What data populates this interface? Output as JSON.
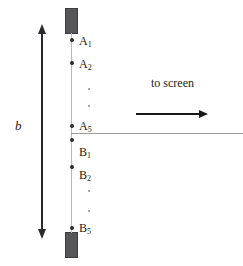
{
  "figure": {
    "background_color": "#ffffff",
    "width": 243,
    "height": 266
  },
  "colors": {
    "bar_fill": "#56565a",
    "bar_stroke": "#3d3d41",
    "slit_plane_line": "#b9b9bd",
    "optical_axis_line": "#9d9da1",
    "marker": "#2b2b2f",
    "ellipsis": "#8c8c90",
    "text": "#1c1c20",
    "arrow": "#18181c"
  },
  "bars": [
    {
      "name": "top-blocking-bar",
      "x": 65,
      "y": 8,
      "w": 13,
      "h": 26
    },
    {
      "name": "bottom-blocking-bar",
      "x": 65,
      "y": 232,
      "w": 13,
      "h": 26
    }
  ],
  "slit_plane": {
    "x": 71,
    "y_top": 33,
    "y_bottom": 233
  },
  "slits": [
    {
      "id": "A1",
      "letter": "A",
      "index": "1",
      "label": "A",
      "sub": "1",
      "y": 40,
      "label_y": 35
    },
    {
      "id": "A2",
      "letter": "A",
      "index": "2",
      "label": "A",
      "sub": "2",
      "y": 63,
      "label_y": 58
    },
    {
      "id": "A5",
      "letter": "A",
      "index": "5",
      "label": "A",
      "sub": "5",
      "y": 126,
      "label_y": 121
    },
    {
      "id": "B1",
      "letter": "B",
      "index": "1",
      "label": "B",
      "sub": "1",
      "y": 140,
      "label_y": 146
    },
    {
      "id": "B2",
      "letter": "B",
      "index": "2",
      "label": "B",
      "sub": "2",
      "y": 167,
      "label_y": 169
    },
    {
      "id": "B5",
      "letter": "B",
      "index": "5",
      "label": "B",
      "sub": "5",
      "y": 228,
      "label_y": 223
    }
  ],
  "ellipses": [
    {
      "group": "A-group",
      "dots_y": [
        88,
        105
      ]
    },
    {
      "group": "B-group",
      "dots_y": [
        190,
        210
      ]
    }
  ],
  "optical_axis": {
    "x_start": 71,
    "x_end": 243,
    "y": 133
  },
  "direction_arrow": {
    "label": "to screen",
    "label_x": 151,
    "label_y": 76,
    "x_start": 136,
    "x_end": 200,
    "y": 114,
    "head": "right"
  },
  "dimension": {
    "label": "b",
    "label_x": 15,
    "label_y": 118,
    "x": 41,
    "y_top": 33,
    "y_bottom": 230,
    "heads": "both"
  }
}
